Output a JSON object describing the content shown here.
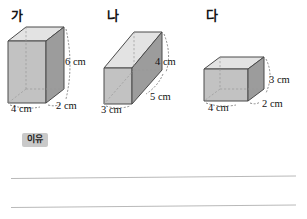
{
  "page": {
    "width": 307,
    "height": 219,
    "background": "#ffffff"
  },
  "figures": [
    {
      "id": "ga",
      "label": "가",
      "label_pos": {
        "x": 11,
        "y": 9
      },
      "box": {
        "x": 6,
        "y": 25,
        "w": 62,
        "h": 85
      },
      "unit": "cm",
      "dimensions": [
        {
          "name": "height",
          "value": 6,
          "text": "6 cm",
          "x": 65,
          "y": 57
        },
        {
          "name": "depth",
          "value": 2,
          "text": "2 cm",
          "x": 56,
          "y": 101
        },
        {
          "name": "width",
          "value": 4,
          "text": "4 cm",
          "x": 11,
          "y": 104
        }
      ]
    },
    {
      "id": "na",
      "label": "나",
      "label_pos": {
        "x": 107,
        "y": 9
      },
      "box": {
        "x": 102,
        "y": 28,
        "w": 76,
        "h": 82
      },
      "unit": "cm",
      "dimensions": [
        {
          "name": "height",
          "value": 4,
          "text": "4 cm",
          "x": 155,
          "y": 57
        },
        {
          "name": "length",
          "value": 5,
          "text": "5 cm",
          "x": 150,
          "y": 92
        },
        {
          "name": "width",
          "value": 3,
          "text": "3 cm",
          "x": 101,
          "y": 105
        }
      ]
    },
    {
      "id": "da",
      "label": "다",
      "label_pos": {
        "x": 206,
        "y": 9
      },
      "box": {
        "x": 202,
        "y": 55,
        "w": 70,
        "h": 58
      },
      "unit": "cm",
      "dimensions": [
        {
          "name": "height",
          "value": 3,
          "text": "3 cm",
          "x": 269,
          "y": 75
        },
        {
          "name": "depth",
          "value": 2,
          "text": "2 cm",
          "x": 262,
          "y": 99
        },
        {
          "name": "width",
          "value": 4,
          "text": "4 cm",
          "x": 208,
          "y": 103
        }
      ]
    }
  ],
  "reason": {
    "badge_label": "이유",
    "badge_color": "#c9c9c9",
    "lines": [
      {
        "x": 11,
        "y": 178,
        "length": 285,
        "angle_deg": -0.5
      },
      {
        "x": 11,
        "y": 207,
        "length": 285,
        "angle_deg": -0.5
      }
    ]
  },
  "palette": {
    "front_face": "#c2c2c2",
    "side_face": "#9c9c9c",
    "top_face": "#e3e3e3",
    "outline": "#4a4a4a",
    "hidden_edge": "#9a9a9a",
    "leader_line": "#6e6e6e",
    "rule_line": "#b9b9b9",
    "text": "#121212"
  }
}
